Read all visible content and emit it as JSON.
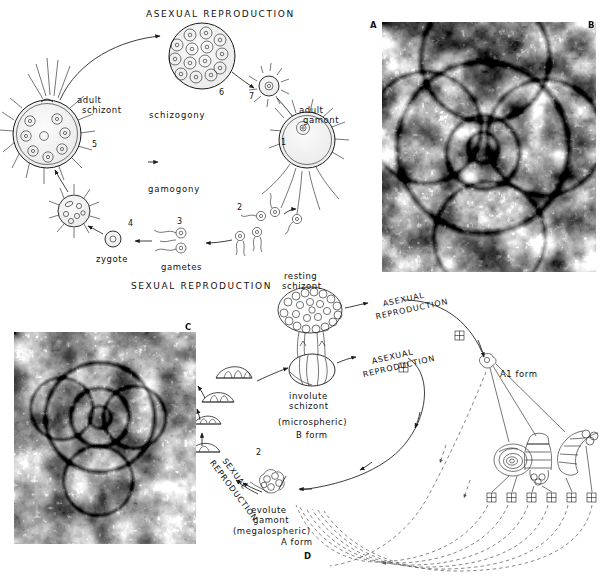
{
  "figure": {
    "panels": [
      {
        "id": "A",
        "label": "A",
        "type": "micrograph"
      },
      {
        "id": "B",
        "label": "B",
        "type": "micrograph"
      },
      {
        "id": "C",
        "label": "C",
        "type": "micrograph"
      },
      {
        "id": "D",
        "label": "D",
        "type": "diagram"
      }
    ]
  },
  "diagram_top": {
    "heading_asexual": "ASEXUAL REPRODUCTION",
    "heading_sexual": "SEXUAL REPRODUCTION",
    "process_upper": "schizogony",
    "process_lower": "gamogony",
    "labels": {
      "adult_schizont_line1": "adult",
      "adult_schizont_line2": "schizont",
      "adult_gamont_line1": "adult",
      "adult_gamont_line2": "gamont",
      "zygote": "zygote",
      "gametes": "gametes"
    },
    "stage_numbers": [
      "1",
      "2",
      "3",
      "4",
      "5",
      "6",
      "7"
    ]
  },
  "diagram_d": {
    "resting_schizont_line1": "resting",
    "resting_schizont_line2": "schizont",
    "involute_line1": "involute",
    "involute_line2": "schizont",
    "involute_line3": "(microspheric)",
    "involute_line4": "B form",
    "evolute_line1": "evolute",
    "evolute_line2": "gamont",
    "evolute_line3": "(megalospheric)",
    "evolute_line4": "A form",
    "a1_form": "A1 form",
    "arc_asexual_top": "ASEXUAL REPRODUCTION",
    "arc_asexual_mid": "ASEXUAL REPRODUCTION",
    "arc_sexual": "SEXUAL REPRODUCTION",
    "stage_number": "2"
  },
  "colors": {
    "ink": "#1a1a1a",
    "dashed": "#555555",
    "paper": "#ffffff"
  }
}
